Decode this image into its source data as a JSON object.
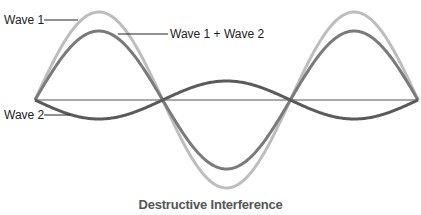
{
  "chart_data": {
    "type": "line",
    "title": "Destructive Interference",
    "xlabel": "",
    "ylabel": "",
    "grid": false,
    "baseline": true,
    "x_range_periods": [
      0,
      1.5
    ],
    "series": [
      {
        "name": "Wave 1",
        "amplitude": 88,
        "phase": "starts upward",
        "color": "#bdbdbd"
      },
      {
        "name": "Wave 2",
        "amplitude": -19,
        "phase": "starts downward (opposite phase)",
        "color": "#5a5a5a"
      },
      {
        "name": "Wave 1 + Wave 2",
        "amplitude": 69,
        "phase": "starts upward",
        "color": "#7a7a7a"
      }
    ]
  },
  "labels": {
    "wave1": "Wave 1",
    "wave2": "Wave 2",
    "sum": "Wave 1 + Wave 2"
  },
  "caption": "Destructive Interference",
  "colors": {
    "wave1": "#bdbdbd",
    "wave2": "#5a5a5a",
    "sum": "#7a7a7a",
    "axis": "#555555"
  }
}
